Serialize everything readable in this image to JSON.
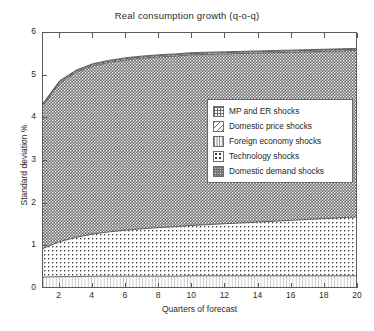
{
  "chart_data": {
    "type": "area",
    "title": "Real consumption growth (q-o-q)",
    "xlabel": "Quarters of forecast",
    "ylabel": "Standard deviation %",
    "xlim": [
      1,
      20
    ],
    "ylim": [
      0,
      6
    ],
    "yticks": [
      "0",
      "1",
      "2",
      "3",
      "4",
      "5",
      "6"
    ],
    "xticks": [
      "2",
      "4",
      "6",
      "8",
      "10",
      "12",
      "14",
      "16",
      "18",
      "20"
    ],
    "grid": false,
    "stacked": true,
    "legend_position": "center-right",
    "x": [
      1,
      2,
      3,
      4,
      5,
      6,
      7,
      8,
      9,
      10,
      11,
      12,
      13,
      14,
      15,
      16,
      17,
      18,
      19,
      20
    ],
    "series": [
      {
        "name": "Foreign economy shocks",
        "pattern": "vertical-lines",
        "values": [
          0.28,
          0.29,
          0.29,
          0.3,
          0.3,
          0.3,
          0.3,
          0.3,
          0.3,
          0.31,
          0.31,
          0.31,
          0.31,
          0.31,
          0.31,
          0.31,
          0.31,
          0.31,
          0.31,
          0.31
        ]
      },
      {
        "name": "Technology shocks",
        "pattern": "dots",
        "values": [
          0.67,
          0.82,
          0.92,
          0.99,
          1.04,
          1.08,
          1.11,
          1.14,
          1.16,
          1.18,
          1.2,
          1.22,
          1.24,
          1.26,
          1.28,
          1.3,
          1.32,
          1.34,
          1.36,
          1.38
        ]
      },
      {
        "name": "Domestic demand shocks",
        "pattern": "dense-dots",
        "values": [
          3.35,
          3.72,
          3.87,
          3.94,
          3.97,
          3.99,
          4.0,
          4.0,
          4.0,
          4.0,
          3.99,
          3.98,
          3.97,
          3.96,
          3.95,
          3.94,
          3.93,
          3.92,
          3.91,
          3.9
        ]
      },
      {
        "name": "Domestic price shocks",
        "pattern": "diagonal-lines",
        "values": [
          0.03,
          0.03,
          0.03,
          0.03,
          0.03,
          0.03,
          0.03,
          0.03,
          0.03,
          0.03,
          0.03,
          0.03,
          0.03,
          0.03,
          0.03,
          0.03,
          0.03,
          0.03,
          0.03,
          0.03
        ]
      },
      {
        "name": "MP and ER shocks",
        "pattern": "grid",
        "values": [
          0.02,
          0.02,
          0.02,
          0.02,
          0.02,
          0.02,
          0.02,
          0.02,
          0.02,
          0.02,
          0.02,
          0.02,
          0.02,
          0.02,
          0.02,
          0.02,
          0.02,
          0.02,
          0.02,
          0.02
        ]
      }
    ],
    "cumulative_top": [
      4.35,
      4.88,
      5.13,
      5.28,
      5.36,
      5.42,
      5.46,
      5.49,
      5.51,
      5.54,
      5.55,
      5.56,
      5.57,
      5.57,
      5.59,
      5.6,
      5.61,
      5.62,
      5.63,
      5.64
    ]
  },
  "legend": {
    "items": [
      {
        "label": "MP and ER shocks",
        "swatch": "grid-swatch"
      },
      {
        "label": "Domestic price shocks",
        "swatch": "diagonal-swatch"
      },
      {
        "label": "Foreign economy shocks",
        "swatch": "vertical-lines-swatch"
      },
      {
        "label": "Technology shocks",
        "swatch": "dots-swatch"
      },
      {
        "label": "Domestic demand shocks",
        "swatch": "dense-dots-swatch"
      }
    ]
  },
  "colors": {
    "axis": "#5a5a5a",
    "text": "#2b2b2b",
    "pattern_ink": "#4a4a4a",
    "domestic_demand_fill": "#6e6e6e"
  }
}
